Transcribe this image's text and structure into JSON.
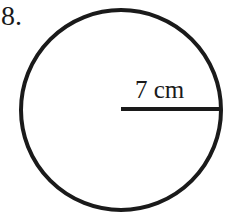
{
  "problem": {
    "number": "8."
  },
  "circle": {
    "center_x": 121,
    "center_y": 110,
    "radius_px": 100,
    "stroke_color": "#1a1a1a",
    "stroke_width": 4
  },
  "radius_segment": {
    "label": "7 cm",
    "value": 7,
    "unit": "cm"
  }
}
